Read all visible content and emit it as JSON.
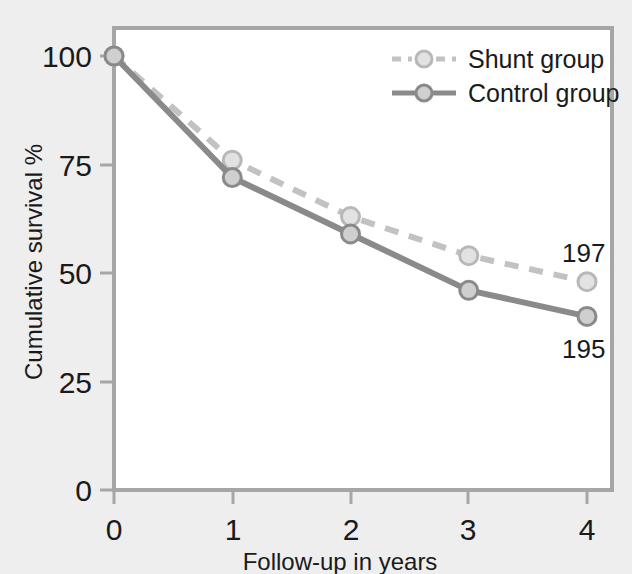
{
  "figure": {
    "background_color": "#eeeeee",
    "plot_background_color": "#ffffff",
    "frame_color": "#a6a6a6"
  },
  "chart_data": {
    "type": "line",
    "title": "",
    "subtitle": "",
    "xlabel": "Follow-up in years",
    "ylabel": "Cumulative survival %",
    "x": [
      0,
      1,
      2,
      3,
      4
    ],
    "xticklabels": [
      "0",
      "1",
      "2",
      "3",
      "4"
    ],
    "yticks": [
      0,
      25,
      50,
      75,
      100
    ],
    "yticklabels": [
      "0",
      "25",
      "50",
      "75",
      "100"
    ],
    "xlim": [
      0,
      4
    ],
    "ylim": [
      0,
      105
    ],
    "grid": false,
    "legend_position": "top-right",
    "series": [
      {
        "name": "Shunt group",
        "values": [
          100,
          76,
          63,
          54,
          48
        ],
        "color": "#c2c2c2",
        "linestyle": "dashed",
        "marker": "circle",
        "end_label": "197"
      },
      {
        "name": "Control group",
        "values": [
          100,
          72,
          59,
          46,
          40
        ],
        "color": "#8a8a8a",
        "linestyle": "solid",
        "marker": "circle",
        "end_label": "195"
      }
    ],
    "annotations": [
      {
        "text": "197",
        "series": "Shunt group",
        "x": 4,
        "position": "above-right"
      },
      {
        "text": "195",
        "series": "Control group",
        "x": 4,
        "position": "below-right"
      }
    ]
  },
  "legend": {
    "entries": [
      {
        "label": "Shunt group"
      },
      {
        "label": "Control group"
      }
    ]
  },
  "axes": {
    "y_title": "Cumulative survival %",
    "x_title": "Follow-up in years",
    "y_tick_0": "0",
    "y_tick_25": "25",
    "y_tick_50": "50",
    "y_tick_75": "75",
    "y_tick_100": "100",
    "x_tick_0": "0",
    "x_tick_1": "1",
    "x_tick_2": "2",
    "x_tick_3": "3",
    "x_tick_4": "4"
  }
}
